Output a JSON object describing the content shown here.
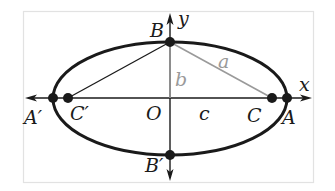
{
  "figure": {
    "colors": {
      "ink": "#1a1a1a",
      "gray": "#9a9a9a",
      "frame": "#e2e2e2",
      "background": "#ffffff"
    },
    "axes": {
      "x_label": "x",
      "y_label": "y"
    },
    "points": {
      "A": "A",
      "A_prime": "A′",
      "B": "B",
      "B_prime": "B′",
      "C": "C",
      "C_prime": "C′",
      "O": "O"
    },
    "segments": {
      "a": "a",
      "b": "b",
      "c": "c"
    }
  }
}
